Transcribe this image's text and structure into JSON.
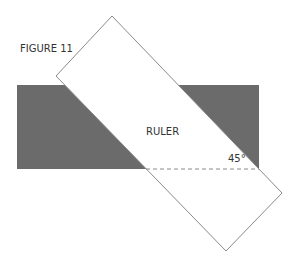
{
  "figure": {
    "title": "FIGURE 11",
    "ruler_label": "RULER",
    "angle_label": "45°"
  },
  "colors": {
    "background": "#ffffff",
    "dark_shape": "#6b6b6b",
    "ruler_fill": "#ffffff",
    "ruler_stroke": "#8a8a8a",
    "dashed_line": "#8a8a8a",
    "text": "#333333"
  },
  "shapes": {
    "dark_rect": {
      "x": 17,
      "y": 85,
      "width": 242,
      "height": 84
    },
    "ruler_vertices": [
      [
        112,
        16
      ],
      [
        282,
        193
      ],
      [
        226,
        251
      ],
      [
        56,
        76
      ]
    ],
    "dashed_line": {
      "x1": 146,
      "y1": 169,
      "x2": 259,
      "y2": 169
    }
  }
}
